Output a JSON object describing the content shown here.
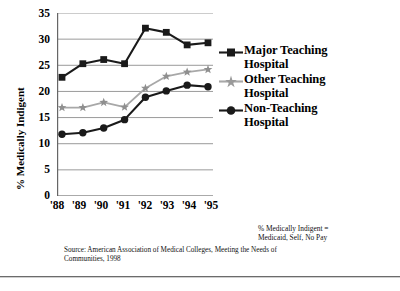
{
  "chart_data": {
    "type": "line",
    "title": "",
    "xlabel": "",
    "ylabel": "% Medically Indigent",
    "categories": [
      "'88",
      "'89",
      "'90",
      "'91",
      "'92",
      "'93",
      "'94",
      "'95"
    ],
    "ylim": [
      0,
      35
    ],
    "ytick_step": 5,
    "yticks": [
      "0",
      "5",
      "10",
      "15",
      "20",
      "25",
      "30",
      "35"
    ],
    "grid": "horizontal",
    "legend_position": "right",
    "series": [
      {
        "name": "Major Teaching Hospital",
        "marker": "square",
        "color": "#1a1a1a",
        "values": [
          22.7,
          25.3,
          26.1,
          25.3,
          32.1,
          31.3,
          28.9,
          29.3
        ]
      },
      {
        "name": "Other Teaching Hospital",
        "marker": "star",
        "color": "#a8a8a8",
        "values": [
          16.9,
          16.9,
          17.9,
          17.0,
          20.6,
          22.9,
          23.7,
          24.2
        ]
      },
      {
        "name": "Non-Teaching Hospital",
        "marker": "circle",
        "color": "#1a1a1a",
        "values": [
          11.8,
          12.1,
          13.0,
          14.6,
          18.9,
          20.1,
          21.2,
          20.9
        ]
      }
    ],
    "annotations": {
      "definition_note_line1": "% Medically Indigent =",
      "definition_note_line2": "Medicaid, Self, No Pay",
      "source_line1": "Source: American Association of Medical Colleges, Meeting the Needs of",
      "source_line2": "Communities, 1998"
    }
  },
  "legend": {
    "items": [
      {
        "label_line1": "Major Teaching",
        "label_line2": "Hospital"
      },
      {
        "label_line1": "Other Teaching",
        "label_line2": "Hospital"
      },
      {
        "label_line1": "Non-Teaching",
        "label_line2": "Hospital"
      }
    ]
  }
}
